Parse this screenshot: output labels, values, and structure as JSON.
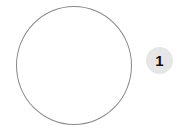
{
  "diagram": {
    "shape": {
      "type": "circle",
      "stroke_color": "#888888",
      "fill_color": "#ffffff"
    },
    "badge": {
      "label": "1",
      "background_color": "#e6e6e6",
      "text_color": "#111111"
    }
  }
}
